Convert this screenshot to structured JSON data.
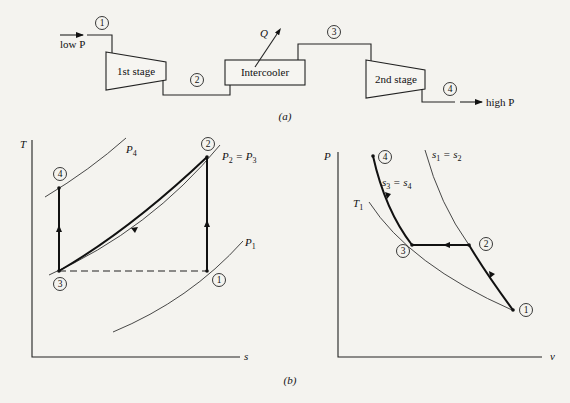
{
  "part_a": {
    "caption": "(a)",
    "inlet_label": "low P",
    "outlet_label": "high P",
    "heat_label": "Q",
    "components": {
      "stage1": "1st stage",
      "intercooler": "Intercooler",
      "stage2": "2nd stage"
    },
    "states": [
      "1",
      "2",
      "3",
      "4"
    ]
  },
  "part_b": {
    "caption": "(b)",
    "ts_diagram": {
      "x_axis": "s",
      "y_axis": "T",
      "isobars": [
        "P4",
        "P2 = P3",
        "P1"
      ],
      "isobar_labels": {
        "p4": {
          "main": "P",
          "sub": "4"
        },
        "p23": {
          "main1": "P",
          "sub1": "2",
          "eq": " = ",
          "main2": "P",
          "sub2": "3"
        },
        "p1": {
          "main": "P",
          "sub": "1"
        }
      },
      "states": [
        "1",
        "2",
        "3",
        "4"
      ]
    },
    "pv_diagram": {
      "x_axis": "v",
      "y_axis": "P",
      "curves": {
        "isentrope_12": {
          "main1": "s",
          "sub1": "1",
          "eq": " = ",
          "main2": "s",
          "sub2": "2"
        },
        "isentrope_34": {
          "main1": "s",
          "sub1": "3",
          "eq": " = ",
          "main2": "s",
          "sub2": "4"
        },
        "isotherm": {
          "main": "T",
          "sub": "1"
        }
      },
      "states": [
        "1",
        "2",
        "3",
        "4"
      ]
    }
  }
}
